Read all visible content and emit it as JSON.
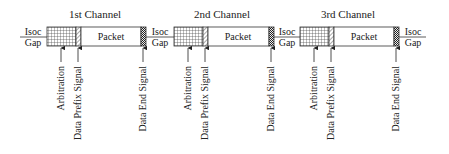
{
  "diagram": {
    "isoc_label": "Isoc",
    "gap_label": "Gap",
    "packet_label": "Packet",
    "signal_labels": {
      "arbitration": "Arbitration",
      "data_prefix": "Data Prefix Signal",
      "data_end": "Data End Signal"
    },
    "channels": [
      {
        "title": "1st Channel",
        "grid_x": 47,
        "hatch_x": 76,
        "end_x": 141,
        "gap_label_x": 22
      },
      {
        "title": "2nd Channel",
        "grid_x": 174,
        "hatch_x": 203,
        "end_x": 269,
        "gap_label_x": 150
      },
      {
        "title": "3rd Channel",
        "grid_x": 300,
        "hatch_x": 329,
        "end_x": 394,
        "gap_label_x": 278
      }
    ],
    "final_gap_label_x": 405,
    "colors": {
      "stroke": "#333333",
      "text": "#222222",
      "background": "#ffffff"
    }
  }
}
